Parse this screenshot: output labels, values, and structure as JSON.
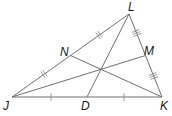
{
  "diagram": {
    "type": "triangle-medians",
    "points": {
      "J": {
        "label": "J",
        "x": 12,
        "y": 97
      },
      "K": {
        "label": "K",
        "x": 162,
        "y": 97
      },
      "L": {
        "label": "L",
        "x": 129,
        "y": 14
      },
      "N": {
        "label": "N",
        "x": 70.5,
        "y": 55.5
      },
      "M": {
        "label": "M",
        "x": 145.5,
        "y": 55.5
      },
      "D": {
        "label": "D",
        "x": 87,
        "y": 97
      }
    },
    "segments": [
      {
        "from": "J",
        "to": "K"
      },
      {
        "from": "K",
        "to": "L"
      },
      {
        "from": "L",
        "to": "J"
      },
      {
        "from": "L",
        "to": "D"
      },
      {
        "from": "J",
        "to": "M"
      },
      {
        "from": "K",
        "to": "N"
      }
    ],
    "tick_marks": {
      "JD_DK": "single",
      "JN_NL": "double",
      "LM_MK": "triple"
    },
    "labels": {
      "L": "L",
      "N": "N",
      "M": "M",
      "J": "J",
      "D": "D",
      "K": "K"
    },
    "colors": {
      "line": "#707070",
      "text": "#1a1a1a"
    }
  }
}
